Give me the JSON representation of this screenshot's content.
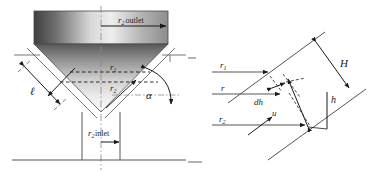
{
  "figure": {
    "width": 379,
    "height": 180,
    "background": "#ffffff",
    "line_color": "#555555",
    "dark_line_color": "#1a1a1a"
  },
  "left_diagram": {
    "name": "conical-hopper-cross-section",
    "labels": {
      "r2_outlet": {
        "symbol": "r",
        "subscript": "2",
        "word": "outlet",
        "full": "r2 outlet"
      },
      "r2_inlet": {
        "symbol": "r",
        "subscript": "2",
        "word": "inlet",
        "full": "r2 inlet"
      },
      "r1": {
        "symbol": "r",
        "subscript": "1",
        "full": "r1"
      },
      "r2": {
        "symbol": "r",
        "subscript": "2",
        "full": "r2"
      },
      "ell": {
        "symbol": "ℓ",
        "full": "ℓ"
      },
      "alpha": {
        "symbol": "α",
        "full": "α"
      }
    },
    "shading": {
      "band_left": "#4a4a4a",
      "band_mid": "#e8e8e8",
      "band_right": "#9a9a9a",
      "cone_top": "#5f5f5f",
      "cone_bottom": "#f2f2f2"
    }
  },
  "right_diagram": {
    "name": "inclined-wall-element",
    "labels": {
      "r1": {
        "symbol": "r",
        "subscript": "1",
        "full": "r1"
      },
      "r": {
        "symbol": "r",
        "full": "r"
      },
      "r2": {
        "symbol": "r",
        "subscript": "2",
        "full": "r2"
      },
      "dh": {
        "symbol": "dh",
        "full": "dh"
      },
      "u": {
        "symbol": "u",
        "full": "u"
      },
      "H": {
        "symbol": "H",
        "full": "H"
      },
      "h": {
        "symbol": "h",
        "full": "h"
      }
    }
  }
}
